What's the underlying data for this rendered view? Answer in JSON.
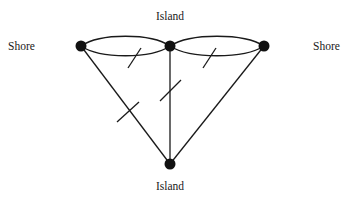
{
  "diagram": {
    "type": "graph",
    "nodes": [
      {
        "id": "shore_left",
        "label": "Shore",
        "x": 81,
        "y": 46,
        "label_x": 8,
        "label_y": 50
      },
      {
        "id": "island_top",
        "label": "Island",
        "x": 170,
        "y": 46,
        "label_x": 170,
        "label_y": 20
      },
      {
        "id": "shore_right",
        "label": "Shore",
        "x": 264,
        "y": 46,
        "label_x": 313,
        "label_y": 50
      },
      {
        "id": "island_bottom",
        "label": "Island",
        "x": 170,
        "y": 164,
        "label_x": 170,
        "label_y": 190
      }
    ],
    "edges": [
      {
        "from": "shore_left",
        "to": "island_top",
        "shape": "arc-upper",
        "marked": false
      },
      {
        "from": "shore_left",
        "to": "island_top",
        "shape": "arc-lower",
        "marked": true
      },
      {
        "from": "island_top",
        "to": "shore_right",
        "shape": "arc-upper",
        "marked": false
      },
      {
        "from": "island_top",
        "to": "shore_right",
        "shape": "arc-lower",
        "marked": true
      },
      {
        "from": "shore_left",
        "to": "island_bottom",
        "shape": "line",
        "marked": true
      },
      {
        "from": "island_top",
        "to": "island_bottom",
        "shape": "line",
        "marked": true
      },
      {
        "from": "shore_right",
        "to": "island_bottom",
        "shape": "line",
        "marked": false
      }
    ],
    "labels": {
      "shore_left": "Shore",
      "island_top": "Island",
      "shore_right": "Shore",
      "island_bottom": "Island"
    },
    "colors": {
      "stroke": "#1a1a1a",
      "node": "#111111",
      "background": "#ffffff"
    }
  }
}
